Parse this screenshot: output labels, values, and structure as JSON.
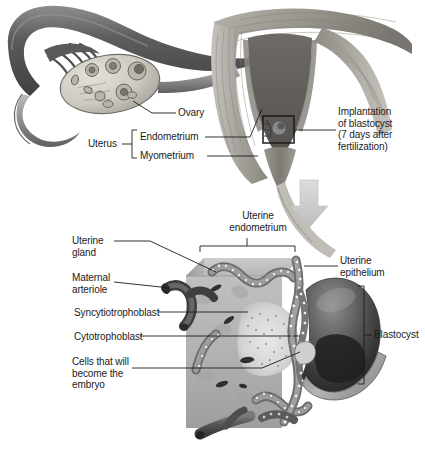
{
  "figure": {
    "background_color": "#ffffff",
    "text_color": "#1b1b1b",
    "arrow_color": "#c9c9c9"
  },
  "upper_panel": {
    "name": "female-reproductive-tract-overview",
    "labels": {
      "ovary": "Ovary",
      "uterus": "Uterus",
      "endometrium": "Endometrium",
      "myometrium": "Myometrium",
      "implantation": "Implantation\nof blastocyst\n(7 days after\nfertilization)"
    },
    "structures": {
      "fallopian_tube": "fallopian-tube",
      "fimbriae": "fimbriae",
      "ovary": "ovary",
      "uterus_body": "uterus-body",
      "uterine_cavity": "uterine-cavity",
      "cervix": "cervix",
      "inset_box": "implantation-site-box"
    }
  },
  "transition": {
    "arrow": "down-arrow-icon",
    "arrow_color": "#c9c9c9"
  },
  "lower_panel": {
    "name": "implantation-detail-block",
    "labels": {
      "uterine_endometrium": "Uterine\nendometrium",
      "uterine_gland": "Uterine\ngland",
      "maternal_arteriole": "Maternal\narteriole",
      "syncytiotrophoblast": "Syncytiotrophoblast",
      "cytotrophoblast": "Cytotrophoblast",
      "cells_embryo": "Cells that will\nbecome the\nembryo",
      "uterine_epithelium": "Uterine\nepithelium",
      "blastocyst": "Blastocyst"
    },
    "structures": {
      "endometrium_block": "endometrium-tissue-block",
      "epithelium_layer": "uterine-epithelium-layer",
      "gland": "uterine-gland",
      "arteriole": "maternal-arteriole",
      "blastocyst_sphere": "blastocyst-sphere",
      "inner_cell_mass": "inner-cell-mass",
      "syncytiotrophoblast_zone": "syncytiotrophoblast-zone",
      "basal_vessel": "basal-blood-vessel"
    }
  },
  "colors": {
    "tissue_light": "#d2d2d2",
    "tissue_mid": "#a8a8a8",
    "tissue_dark": "#6e6e6e",
    "vessel_dark": "#4a4a4a",
    "epithelium": "#8a8a8a",
    "blastocyst_dark": "#2c2c2c",
    "line": "#1b1b1b"
  }
}
